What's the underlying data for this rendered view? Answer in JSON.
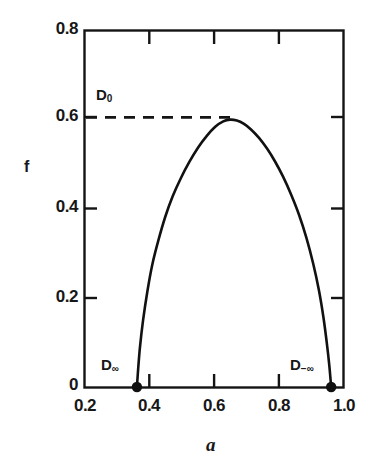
{
  "chart_data": {
    "type": "line",
    "title": "",
    "subtitle": "",
    "xlabel": "a",
    "ylabel": "f",
    "xlim": [
      0.2,
      1.04
    ],
    "ylim": [
      0.0,
      0.8
    ],
    "grid": false,
    "legend": null,
    "x_ticks": [
      {
        "value": 0.2,
        "label": "0.2"
      },
      {
        "value": 0.4,
        "label": "0.4"
      },
      {
        "value": 0.6,
        "label": "0.6"
      },
      {
        "value": 0.8,
        "label": "0.8"
      },
      {
        "value": 1.0,
        "label": "1.0"
      }
    ],
    "y_ticks": [
      {
        "value": 0.0,
        "label": "0"
      },
      {
        "value": 0.2,
        "label": "0.2"
      },
      {
        "value": 0.4,
        "label": "0.4"
      },
      {
        "value": 0.6,
        "label": "0.6"
      },
      {
        "value": 0.8,
        "label": "0.8"
      }
    ],
    "series": [
      {
        "name": "f(a) singularity spectrum",
        "color": "#111111",
        "style": "solid",
        "x": [
          0.37,
          0.374,
          0.38,
          0.39,
          0.404,
          0.42,
          0.44,
          0.462,
          0.486,
          0.512,
          0.54,
          0.568,
          0.596,
          0.624,
          0.65,
          0.672,
          0.694,
          0.716,
          0.74,
          0.766,
          0.792,
          0.818,
          0.844,
          0.87,
          0.896,
          0.92,
          0.942,
          0.96,
          0.975,
          0.986,
          0.994,
          1.0
        ],
        "y": [
          0.0,
          0.04,
          0.09,
          0.15,
          0.215,
          0.275,
          0.33,
          0.382,
          0.428,
          0.468,
          0.505,
          0.537,
          0.563,
          0.584,
          0.596,
          0.6,
          0.598,
          0.591,
          0.578,
          0.559,
          0.535,
          0.506,
          0.472,
          0.432,
          0.386,
          0.334,
          0.276,
          0.218,
          0.156,
          0.098,
          0.048,
          0.0
        ]
      }
    ],
    "markers": [
      {
        "name": "D-infinity-point",
        "x": 0.37,
        "y": 0.0,
        "label": "D",
        "sublabel": "∞",
        "label_side": "left"
      },
      {
        "name": "D-minus-infinity-point",
        "x": 1.0,
        "y": 0.0,
        "label": "D",
        "sublabel": "−∞",
        "label_side": "left"
      }
    ],
    "annotations": [
      {
        "name": "d-zero-dashed-line",
        "type": "hline-segment",
        "y": 0.605,
        "x_start": 0.2,
        "x_end": 0.672,
        "style": "dashed",
        "label": "D",
        "sublabel": "0"
      }
    ]
  },
  "labels": {
    "y_axis_title": "f",
    "x_axis_title": "a",
    "d_zero": "D",
    "d_zero_sub": "0",
    "d_inf": "D",
    "d_inf_sub": "∞",
    "d_minus_inf": "D",
    "d_minus_inf_sub": "−∞",
    "ytick_0_8": "0.8",
    "ytick_0_6": "0.6",
    "ytick_0_4": "0.4",
    "ytick_0_2": "0.2",
    "ytick_0": "0",
    "xtick_0_2": "0.2",
    "xtick_0_4": "0.4",
    "xtick_0_6": "0.6",
    "xtick_0_8": "0.8",
    "xtick_1_0": "1.0"
  },
  "colors": {
    "background": "#ffffff",
    "axis": "#141414",
    "curve": "#111111",
    "text": "#171717"
  }
}
